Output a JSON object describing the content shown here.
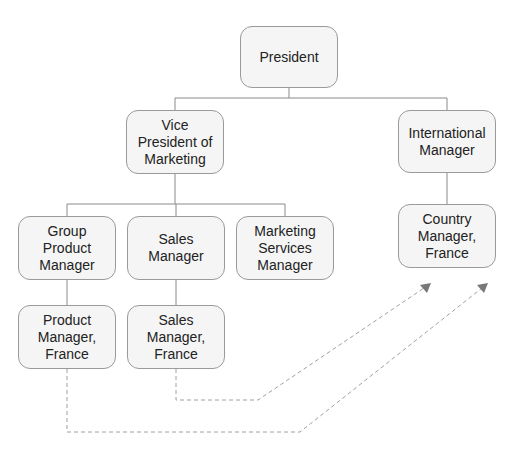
{
  "diagram": {
    "type": "org-chart",
    "nodes": {
      "president": "President",
      "vp_marketing": "Vice\nPresident of\nMarketing",
      "international_manager": "International\nManager",
      "country_manager_france": "Country\nManager,\nFrance",
      "group_product_manager": "Group\nProduct\nManager",
      "sales_manager": "Sales\nManager",
      "marketing_services_manager": "Marketing\nServices\nManager",
      "product_manager_france": "Product\nManager,\nFrance",
      "sales_manager_france": "Sales\nManager,\nFrance"
    },
    "edges": [
      {
        "from": "President",
        "to": "Vice President of Marketing",
        "style": "solid"
      },
      {
        "from": "President",
        "to": "International Manager",
        "style": "solid"
      },
      {
        "from": "Vice President of Marketing",
        "to": "Group Product Manager",
        "style": "solid"
      },
      {
        "from": "Vice President of Marketing",
        "to": "Sales Manager",
        "style": "solid"
      },
      {
        "from": "Vice President of Marketing",
        "to": "Marketing Services Manager",
        "style": "solid"
      },
      {
        "from": "International Manager",
        "to": "Country Manager, France",
        "style": "solid"
      },
      {
        "from": "Group Product Manager",
        "to": "Product Manager, France",
        "style": "solid"
      },
      {
        "from": "Sales Manager",
        "to": "Sales Manager, France",
        "style": "solid"
      },
      {
        "from": "Sales Manager, France",
        "to": "Country Manager, France",
        "style": "dashed-arrow"
      },
      {
        "from": "Product Manager, France",
        "to": "Country Manager, France",
        "style": "dashed-arrow"
      }
    ],
    "colors": {
      "node_fill": "#f5f5f5",
      "node_border": "#9a9a9a",
      "solid_line": "#8a8a8a",
      "dashed_line": "#a0a0a0",
      "arrowhead": "#777777"
    }
  }
}
